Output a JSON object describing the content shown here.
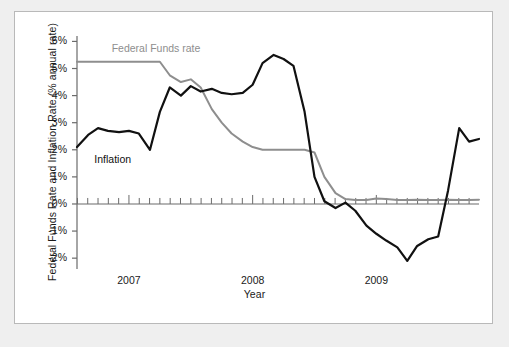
{
  "figure": {
    "y_axis_title": "Federal Funds Rate and Inflation Rate (% annual rate)",
    "x_axis_title": "Year",
    "label_federal_funds": "Federal Funds rate",
    "label_inflation": "Inflation",
    "colors": {
      "inflation_line": "#111111",
      "federal_funds_line": "#8e8e8e",
      "axis": "#6b6b6b",
      "panel_background": "#ffffff",
      "page_background": "#efefef",
      "frame_border": "#b9b9b9"
    }
  },
  "chart_data": {
    "type": "line",
    "title": "",
    "xlabel": "Year",
    "ylabel": "Federal Funds Rate and Inflation Rate (% annual rate)",
    "xlim": [
      2006.58,
      2009.83
    ],
    "ylim": [
      -2.4,
      6.2
    ],
    "ytick_values": [
      6,
      5,
      4,
      3,
      2,
      1,
      0,
      -1,
      -2
    ],
    "ytick_labels": [
      "6%",
      "5%",
      "4%",
      "3%",
      "2%",
      "1%",
      "0%",
      "-1%",
      "-2%"
    ],
    "xtick_labels": [
      "2007",
      "2008",
      "2009"
    ],
    "xtick_values": [
      2007.0,
      2008.0,
      2009.0
    ],
    "minor_ticks": "monthly",
    "grid": false,
    "legend_position": "inline-annotations",
    "zero_line": 0,
    "series": [
      {
        "name": "Inflation",
        "color": "#111111",
        "x": [
          2006.58,
          2006.67,
          2006.75,
          2006.83,
          2006.92,
          2007.0,
          2007.08,
          2007.17,
          2007.25,
          2007.33,
          2007.42,
          2007.5,
          2007.58,
          2007.67,
          2007.75,
          2007.83,
          2007.92,
          2008.0,
          2008.08,
          2008.17,
          2008.25,
          2008.33,
          2008.42,
          2008.5,
          2008.58,
          2008.67,
          2008.75,
          2008.83,
          2008.92,
          2009.0,
          2009.08,
          2009.17,
          2009.25,
          2009.33,
          2009.42,
          2009.5,
          2009.58,
          2009.67,
          2009.75,
          2009.83
        ],
        "y": [
          2.1,
          2.55,
          2.8,
          2.7,
          2.65,
          2.7,
          2.6,
          2.0,
          3.4,
          4.3,
          4.0,
          4.35,
          4.15,
          4.25,
          4.1,
          4.05,
          4.1,
          4.4,
          5.2,
          5.5,
          5.35,
          5.1,
          3.4,
          1.0,
          0.1,
          -0.15,
          0.05,
          -0.25,
          -0.8,
          -1.1,
          -1.35,
          -1.6,
          -2.1,
          -1.55,
          -1.3,
          -1.2,
          0.5,
          2.8,
          2.3,
          2.4
        ]
      },
      {
        "name": "Federal Funds rate",
        "color": "#8e8e8e",
        "x": [
          2006.58,
          2006.67,
          2006.75,
          2006.83,
          2006.92,
          2007.0,
          2007.08,
          2007.17,
          2007.25,
          2007.33,
          2007.42,
          2007.5,
          2007.58,
          2007.67,
          2007.75,
          2007.83,
          2007.92,
          2008.0,
          2008.08,
          2008.17,
          2008.25,
          2008.33,
          2008.42,
          2008.5,
          2008.58,
          2008.67,
          2008.75,
          2008.83,
          2008.92,
          2009.0,
          2009.08,
          2009.17,
          2009.25,
          2009.33,
          2009.42,
          2009.5,
          2009.58,
          2009.67,
          2009.75,
          2009.83
        ],
        "y": [
          5.25,
          5.25,
          5.25,
          5.25,
          5.25,
          5.25,
          5.25,
          5.25,
          5.25,
          4.75,
          4.5,
          4.6,
          4.3,
          3.5,
          3.0,
          2.6,
          2.3,
          2.1,
          2.0,
          2.0,
          2.0,
          2.0,
          2.0,
          1.9,
          1.0,
          0.4,
          0.18,
          0.15,
          0.15,
          0.2,
          0.18,
          0.15,
          0.15,
          0.16,
          0.15,
          0.15,
          0.16,
          0.15,
          0.15,
          0.16
        ]
      }
    ]
  }
}
